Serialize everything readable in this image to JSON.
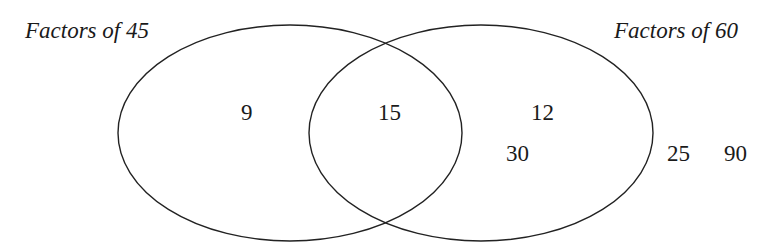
{
  "diagram": {
    "type": "venn",
    "sets": [
      {
        "label": "Factors of 45"
      },
      {
        "label": "Factors of 60"
      }
    ],
    "regions": {
      "only_45": [
        "9"
      ],
      "both": [
        "15"
      ],
      "only_60": [
        "12",
        "30"
      ],
      "outside": [
        "25",
        "90"
      ]
    },
    "stroke_color": "#222222"
  }
}
